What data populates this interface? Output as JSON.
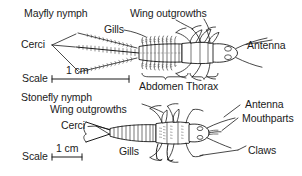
{
  "figure": {
    "background_color": "#ffffff",
    "ink_color": "#1b1b1b"
  },
  "specimens": [
    {
      "name": "mayfly-nymph",
      "title": "Mayfly nymph",
      "scale_label": "Scale",
      "scale_value": "1 cm",
      "labels": [
        "Mayfly nymph",
        "Wing outgrowths",
        "Gills",
        "Cerci",
        "Antenna",
        "Abdomen",
        "Thorax"
      ]
    },
    {
      "name": "stonefly-nymph",
      "title": "Stonefly nymph",
      "scale_label": "Scale",
      "scale_value": "1 cm",
      "labels": [
        "Stonefly nymph",
        "Wing outgrowths",
        "Cerci",
        "Gills",
        "Antenna",
        "Mouthparts",
        "Claws"
      ]
    }
  ],
  "annotations": {
    "mayfly_title": "Mayfly nymph",
    "mayfly_wing_outgrowths": "Wing outgrowths",
    "mayfly_gills": "Gills",
    "mayfly_cerci": "Cerci",
    "mayfly_antenna": "Antenna",
    "mayfly_scale_label": "Scale",
    "mayfly_scale_value": "1 cm",
    "abdomen": "Abdomen",
    "thorax": "Thorax",
    "stonefly_title": "Stonefly nymph",
    "stonefly_wing_outgrowths": "Wing outgrowths",
    "stonefly_cerci": "Cerci",
    "stonefly_gills": "Gills",
    "stonefly_antenna": "Antenna",
    "stonefly_mouthparts": "Mouthparts",
    "stonefly_claws": "Claws",
    "stonefly_scale_label": "Scale",
    "stonefly_scale_value": "1 cm"
  }
}
